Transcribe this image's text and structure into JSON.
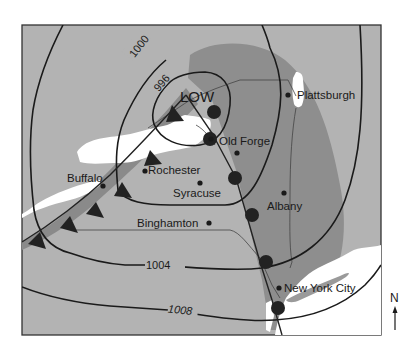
{
  "map": {
    "title": "",
    "colors": {
      "background": "#ffffff",
      "land": "#b3b3b3",
      "precip_zone": "#8e8e8e",
      "front_band": "#8a8a8a",
      "water": "#ffffff",
      "lines": "#1a1a1a",
      "front_symbols": "#222222"
    },
    "pressure_center": {
      "label": "LOW"
    },
    "isobars": [
      {
        "label": "996",
        "unit": "mb"
      },
      {
        "label": "1000",
        "unit": "mb"
      },
      {
        "label": "1004",
        "unit": "mb"
      },
      {
        "label": "1008",
        "unit": "mb"
      }
    ],
    "cities": [
      {
        "name": "Plattsburgh"
      },
      {
        "name": "Old Forge"
      },
      {
        "name": "Rochester"
      },
      {
        "name": "Buffalo"
      },
      {
        "name": "Syracuse"
      },
      {
        "name": "Albany"
      },
      {
        "name": "Binghamton"
      },
      {
        "name": "New York City"
      }
    ],
    "fronts": [
      {
        "type": "cold front",
        "symbol": "triangles",
        "direction": "southwest from LOW"
      },
      {
        "type": "warm front",
        "symbol": "semicircles",
        "direction": "south from LOW"
      }
    ],
    "compass": {
      "label": "N",
      "icon": "north-arrow-icon"
    }
  }
}
